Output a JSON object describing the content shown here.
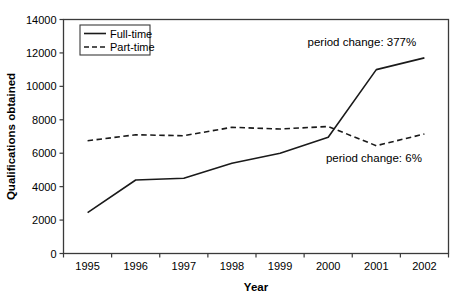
{
  "figure": {
    "background_color": "#ffffff",
    "frame_color": "#3a3a3a",
    "line_color": "#1a1a1a",
    "text_color": "#000000"
  },
  "chart_data": {
    "type": "line",
    "title": "",
    "xlabel": "Year",
    "ylabel": "Qualifications obtained",
    "categories": [
      "1995",
      "1996",
      "1997",
      "1998",
      "1999",
      "2000",
      "2001",
      "2002"
    ],
    "ylim": [
      0,
      14000
    ],
    "yticks": [
      0,
      2000,
      4000,
      6000,
      8000,
      10000,
      12000,
      14000
    ],
    "grid": false,
    "legend_position": "top-left-inside",
    "legend_entries": [
      "Full-time",
      "Part-time"
    ],
    "series": [
      {
        "name": "Full-time",
        "line_style": "solid",
        "color": "#1a1a1a",
        "values": [
          2450,
          4400,
          4500,
          5400,
          6000,
          6950,
          11000,
          11700
        ]
      },
      {
        "name": "Part-time",
        "line_style": "dashed",
        "color": "#1a1a1a",
        "values": [
          6750,
          7100,
          7050,
          7550,
          7450,
          7600,
          6450,
          7150
        ]
      }
    ],
    "annotations": [
      {
        "text": "period change: 377%",
        "x_category_index": 6.2,
        "y_value": 12400
      },
      {
        "text": "period change: 6%",
        "x_category_index": 6.45,
        "y_value": 5470
      }
    ]
  }
}
